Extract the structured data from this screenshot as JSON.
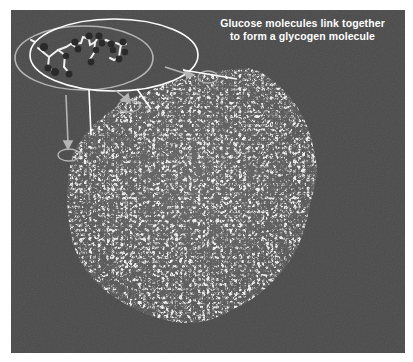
{
  "figure": {
    "caption_line1": "Glucose molecules link together",
    "caption_line2": "to form a glycogen molecule",
    "background_color": "#4a4a4a",
    "border_color": "#ffffff",
    "callout_gray_color": "#b4b4b4",
    "callout_white_color": "#ffffff",
    "elements": {
      "glucose_inset": "magnified glucose molecules (ball-and-stick)",
      "glycogen_mass": "branched glycogen molecule network",
      "callout_count": 3
    }
  }
}
